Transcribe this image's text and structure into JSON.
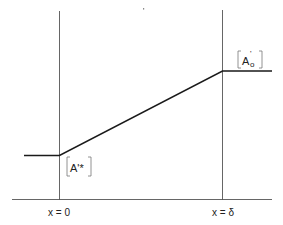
{
  "diagram": {
    "type": "piecewise-linear-profile",
    "colors": {
      "background": "#ffffff",
      "axis_line": "#555555",
      "profile_line": "#1a1a1a",
      "text": "#222222"
    },
    "labels": {
      "left_value": "A'*",
      "right_value_base": "A",
      "right_value_prime": "'",
      "right_value_sub": "o",
      "left_boundary": "x = 0",
      "right_boundary": "x = δ"
    }
  }
}
